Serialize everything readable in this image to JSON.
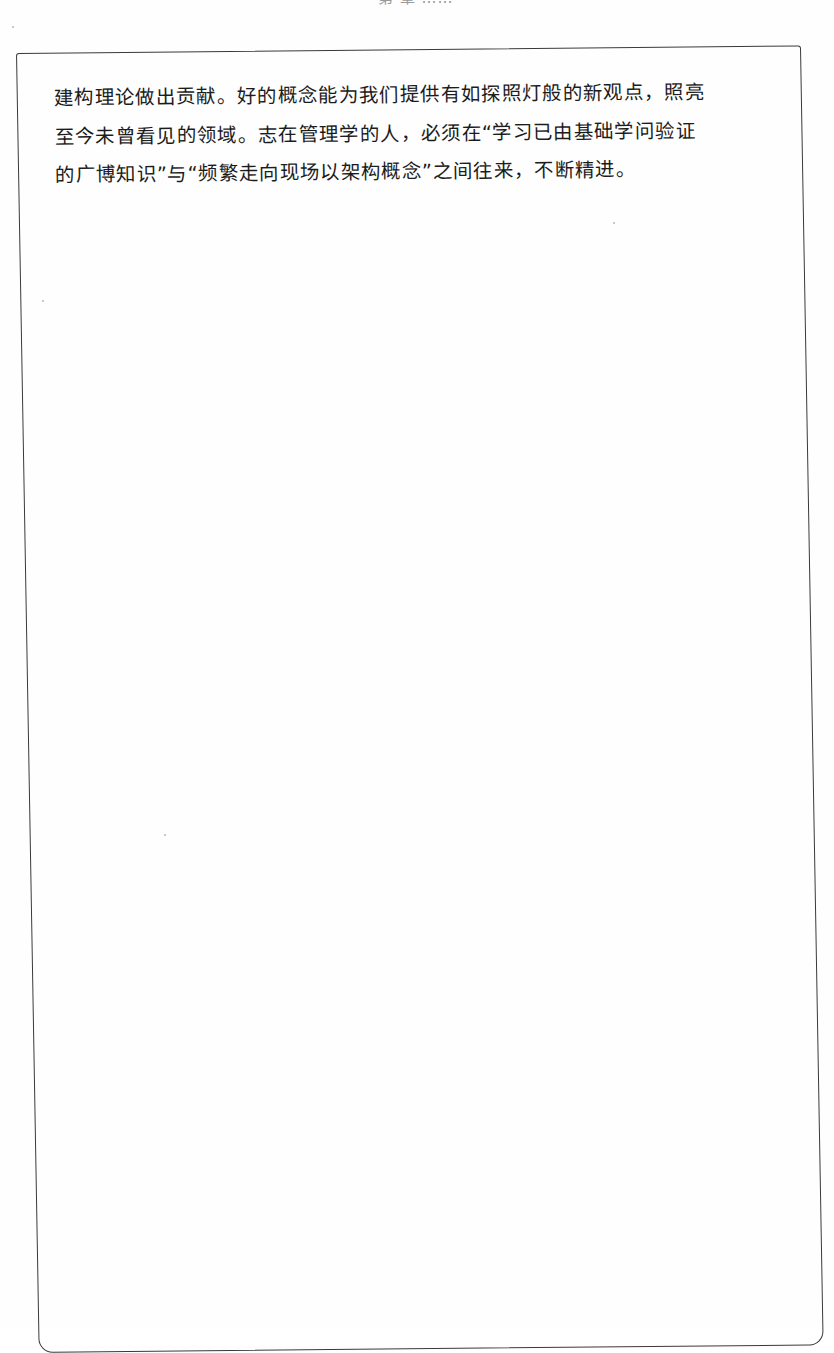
{
  "page": {
    "running_header": "第 章 ……"
  },
  "box": {
    "lines": [
      "建构理论做出贡献。好的概念能为我们提供有如探照灯般的新观点，照亮",
      "至今未曾看见的领域。志在管理学的人，必须在“学习已由基础学问验证",
      "的广博知识”与“频繁走向现场以架构概念”之间往来，不断精进。"
    ]
  },
  "colors": {
    "text": "#1c1c1c",
    "border": "#3a3a3a",
    "header": "#9a9a9a",
    "background": "#fefefe"
  }
}
